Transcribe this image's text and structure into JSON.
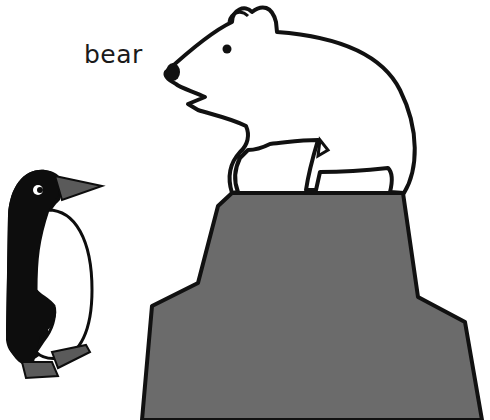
{
  "label": {
    "text": "bear"
  },
  "figures": [
    {
      "name": "polar-bear",
      "fill": "#ffffff",
      "outline": "#111111"
    },
    {
      "name": "rock",
      "fill": "#6b6b6b",
      "outline": "#111111"
    },
    {
      "name": "penguin",
      "body": "#0d0d0d",
      "belly": "#ffffff",
      "beak_feet": "#5a5a5a"
    }
  ],
  "colors": {
    "background": "#ffffff",
    "ink": "#111111",
    "rock": "#6b6b6b",
    "beak": "#5a5a5a"
  }
}
